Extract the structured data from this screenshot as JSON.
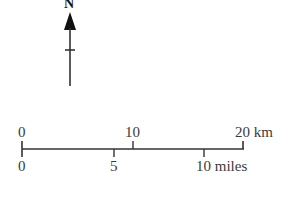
{
  "north_arrow": {
    "label": "N",
    "icon": "north-arrow-icon",
    "color": "#111111"
  },
  "scale_bar": {
    "km": {
      "ticks": [
        {
          "value": "0",
          "x": 22
        },
        {
          "value": "10",
          "x": 133
        },
        {
          "value": "20 km",
          "x": 243
        }
      ],
      "unit": "km"
    },
    "miles": {
      "ticks": [
        {
          "value": "0",
          "x": 22
        },
        {
          "value": "5",
          "x": 114
        },
        {
          "value": "10 miles",
          "x": 204
        }
      ],
      "unit": "miles"
    },
    "line_color": "#333333"
  }
}
